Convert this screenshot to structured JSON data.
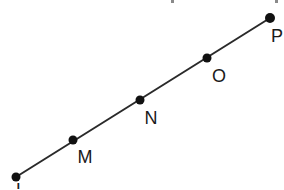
{
  "figure": {
    "type": "collinear-points-line",
    "canvas": {
      "width": 284,
      "height": 189,
      "background": "#ffffff"
    },
    "line": {
      "name": "line-LP",
      "x1": 16,
      "y1": 177,
      "x2": 270,
      "y2": 18,
      "color": "#2a2a2a",
      "width": 2
    },
    "points": [
      {
        "id": "L",
        "label": "L",
        "x": 16,
        "y": 177,
        "r": 4.5,
        "label_x": 21,
        "label_y": 196,
        "label_clipped": true,
        "color": "#111111"
      },
      {
        "id": "M",
        "label": "M",
        "x": 73,
        "y": 140,
        "r": 4.5,
        "label_x": 85,
        "label_y": 163,
        "label_clipped": false,
        "color": "#111111"
      },
      {
        "id": "N",
        "label": "N",
        "x": 140,
        "y": 100,
        "r": 4.5,
        "label_x": 151,
        "label_y": 124,
        "label_clipped": false,
        "color": "#111111"
      },
      {
        "id": "O",
        "label": "O",
        "x": 207,
        "y": 58,
        "r": 4.5,
        "label_x": 219,
        "label_y": 82,
        "label_clipped": false,
        "color": "#111111"
      },
      {
        "id": "P",
        "label": "P",
        "x": 270,
        "y": 18,
        "r": 5.0,
        "label_x": 277,
        "label_y": 42,
        "label_clipped": false,
        "color": "#111111"
      }
    ],
    "edge_artifacts": [
      {
        "id": "top-mark-1",
        "x": 171,
        "y": 0,
        "w": 3,
        "h": 3
      },
      {
        "id": "top-mark-2",
        "x": 275,
        "y": 0,
        "w": 3,
        "h": 3
      }
    ]
  }
}
